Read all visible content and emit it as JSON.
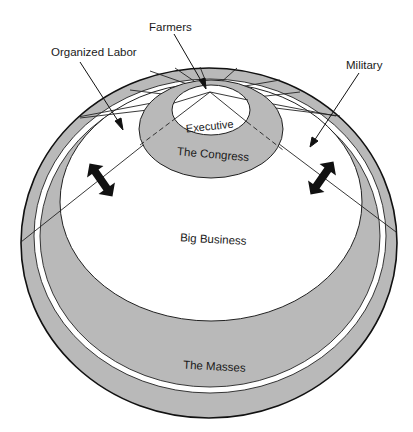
{
  "diagram": {
    "type": "power-elite concentric ellipse diagram",
    "colors": {
      "band": "#b9b9b9",
      "inner": "#ffffff",
      "stroke": "#222222",
      "arrow_fill": "#111111"
    },
    "regions": {
      "executive": "Executive",
      "congress": "The Congress",
      "big_business": "Big Business",
      "masses": "The Masses"
    },
    "callouts": {
      "farmers": "Farmers",
      "organized_labor": "Organized Labor",
      "military": "Military"
    }
  }
}
